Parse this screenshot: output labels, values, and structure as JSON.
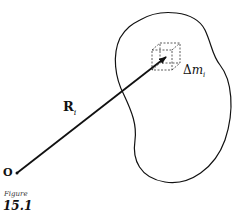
{
  "figure": {
    "caption_word": "Figure",
    "number": "15.1"
  },
  "labels": {
    "origin": "O",
    "position_vector": "R",
    "position_vector_subscript": "i",
    "mass_element_delta": "Δ",
    "mass_element_var": "m",
    "mass_element_subscript": "i"
  },
  "colors": {
    "ink": "#111111",
    "background": "#ffffff"
  }
}
